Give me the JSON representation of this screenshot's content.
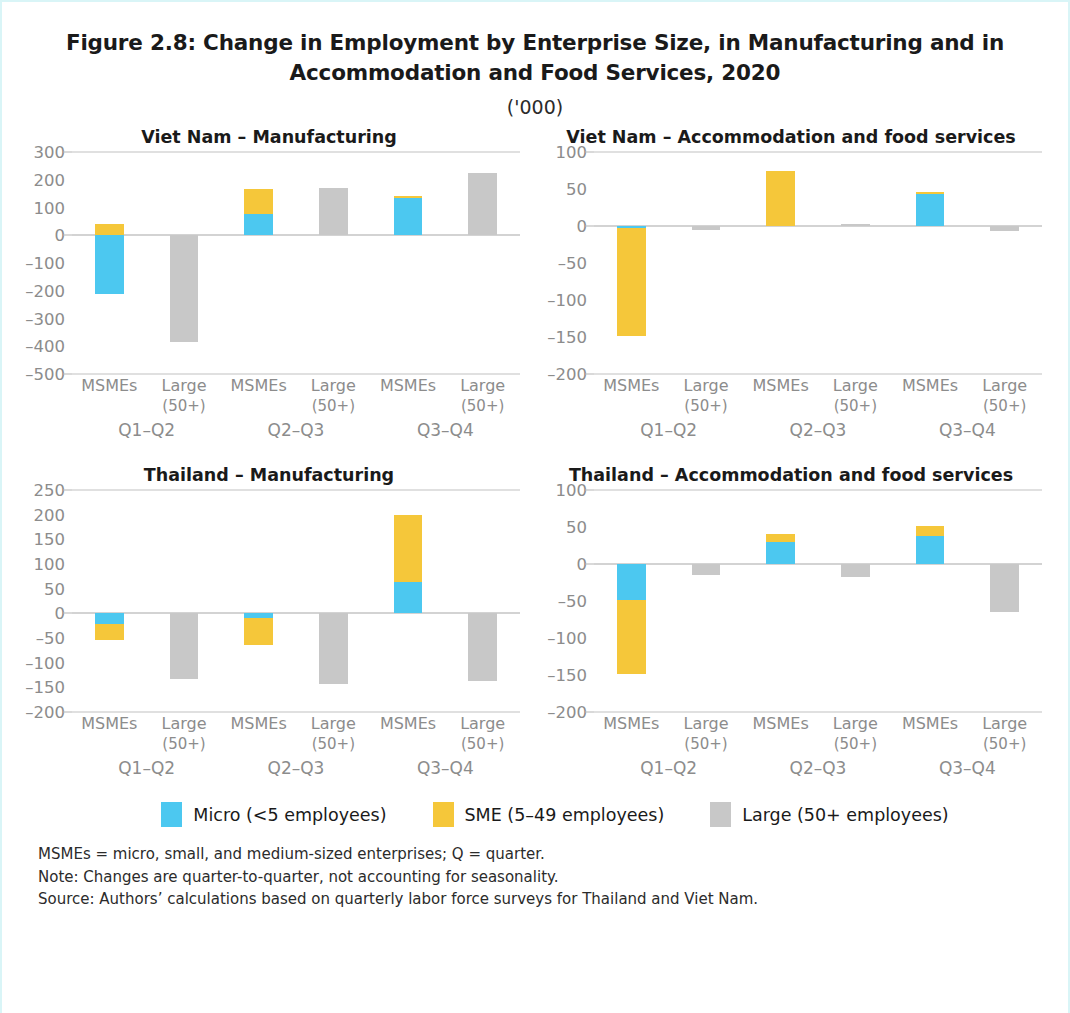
{
  "figure": {
    "title": "Figure 2.8: Change in Employment by Enterprise Size, in Manufacturing and in Accommodation and Food Services, 2020",
    "subtitle": "('000)"
  },
  "legend": {
    "items": [
      {
        "label": "Micro (<5 employees)",
        "color": "#4CC8F0",
        "key": "micro"
      },
      {
        "label": "SME (5–49 employees)",
        "color": "#F5C73A",
        "key": "sme"
      },
      {
        "label": "Large (50+ employees)",
        "color": "#C8C8C8",
        "key": "large"
      }
    ]
  },
  "notes": [
    "MSMEs = micro, small, and medium-sized enterprises; Q = quarter.",
    "Note: Changes are quarter-to-quarter, not accounting for seasonality.",
    "Source: Authors’ calculations based on quarterly labor force surveys for Thailand and Viet Nam."
  ],
  "x_labels": {
    "msmes": "MSMEs",
    "large_main": "Large",
    "large_sub": "(50+)",
    "groups": [
      "Q1–Q2",
      "Q2–Q3",
      "Q3–Q4"
    ]
  },
  "chart_data": [
    {
      "id": "vn-manufacturing",
      "type": "bar",
      "title": "Viet Nam – Manufacturing",
      "xlabel": "",
      "ylabel": "",
      "ylim": [
        -500,
        300
      ],
      "yticks": [
        300,
        200,
        100,
        0,
        -100,
        -200,
        -300,
        -400,
        -500
      ],
      "ytick_labels": [
        "300",
        "200",
        "100",
        "0",
        "–100",
        "–200",
        "–300",
        "–400",
        "–500"
      ],
      "gridlines": [
        300,
        0,
        -500
      ],
      "grid": false,
      "legend_position": "bottom",
      "categories": [
        "Q1–Q2",
        "Q2–Q3",
        "Q3–Q4"
      ],
      "bars": [
        {
          "group": "Q1–Q2",
          "cat": "MSMEs",
          "micro": -210,
          "sme": 40
        },
        {
          "group": "Q1–Q2",
          "cat": "Large (50+)",
          "large": -385
        },
        {
          "group": "Q2–Q3",
          "cat": "MSMEs",
          "micro": 75,
          "sme": 90
        },
        {
          "group": "Q2–Q3",
          "cat": "Large (50+)",
          "large": 170
        },
        {
          "group": "Q3–Q4",
          "cat": "MSMEs",
          "micro": 135,
          "sme": 8
        },
        {
          "group": "Q3–Q4",
          "cat": "Large (50+)",
          "large": 225
        }
      ]
    },
    {
      "id": "vn-accommodation",
      "type": "bar",
      "title": "Viet Nam – Accommodation and food services",
      "xlabel": "",
      "ylabel": "",
      "ylim": [
        -200,
        100
      ],
      "yticks": [
        100,
        50,
        0,
        -50,
        -100,
        -150,
        -200
      ],
      "ytick_labels": [
        "100",
        "50",
        "0",
        "–50",
        "–100",
        "–150",
        "–200"
      ],
      "gridlines": [
        100,
        0,
        -200
      ],
      "grid": false,
      "legend_position": "bottom",
      "categories": [
        "Q1–Q2",
        "Q2–Q3",
        "Q3–Q4"
      ],
      "bars": [
        {
          "group": "Q1–Q2",
          "cat": "MSMEs",
          "micro": -3,
          "sme": -145
        },
        {
          "group": "Q1–Q2",
          "cat": "Large (50+)",
          "large": -5
        },
        {
          "group": "Q2–Q3",
          "cat": "MSMEs",
          "micro": 0,
          "sme": 75
        },
        {
          "group": "Q2–Q3",
          "cat": "Large (50+)",
          "large": 3
        },
        {
          "group": "Q3–Q4",
          "cat": "MSMEs",
          "micro": 43,
          "sme": 3
        },
        {
          "group": "Q3–Q4",
          "cat": "Large (50+)",
          "large": -7
        }
      ]
    },
    {
      "id": "th-manufacturing",
      "type": "bar",
      "title": "Thailand – Manufacturing",
      "xlabel": "",
      "ylabel": "",
      "ylim": [
        -200,
        250
      ],
      "yticks": [
        250,
        200,
        150,
        100,
        50,
        0,
        -50,
        -100,
        -150,
        -200
      ],
      "ytick_labels": [
        "250",
        "200",
        "150",
        "100",
        "50",
        "0",
        "–50",
        "–100",
        "–150",
        "–200"
      ],
      "gridlines": [
        250,
        0,
        -200
      ],
      "grid": false,
      "legend_position": "bottom",
      "categories": [
        "Q1–Q2",
        "Q2–Q3",
        "Q3–Q4"
      ],
      "bars": [
        {
          "group": "Q1–Q2",
          "cat": "MSMEs",
          "micro": -22,
          "sme": -33
        },
        {
          "group": "Q1–Q2",
          "cat": "Large (50+)",
          "large": -133
        },
        {
          "group": "Q2–Q3",
          "cat": "MSMEs",
          "micro": -10,
          "sme": -55
        },
        {
          "group": "Q2–Q3",
          "cat": "Large (50+)",
          "large": -143
        },
        {
          "group": "Q3–Q4",
          "cat": "MSMEs",
          "micro": 63,
          "sme": 137
        },
        {
          "group": "Q3–Q4",
          "cat": "Large (50+)",
          "large": -138
        }
      ]
    },
    {
      "id": "th-accommodation",
      "type": "bar",
      "title": "Thailand – Accommodation and food services",
      "xlabel": "",
      "ylabel": "",
      "ylim": [
        -200,
        100
      ],
      "yticks": [
        100,
        50,
        0,
        -50,
        -100,
        -150,
        -200
      ],
      "ytick_labels": [
        "100",
        "50",
        "0",
        "–50",
        "–100",
        "–150",
        "–200"
      ],
      "gridlines": [
        100,
        0,
        -200
      ],
      "grid": false,
      "legend_position": "bottom",
      "categories": [
        "Q1–Q2",
        "Q2–Q3",
        "Q3–Q4"
      ],
      "bars": [
        {
          "group": "Q1–Q2",
          "cat": "MSMEs",
          "micro": -48,
          "sme": -100
        },
        {
          "group": "Q1–Q2",
          "cat": "Large (50+)",
          "large": -15
        },
        {
          "group": "Q2–Q3",
          "cat": "MSMEs",
          "micro": 30,
          "sme": 10
        },
        {
          "group": "Q2–Q3",
          "cat": "Large (50+)",
          "large": -18
        },
        {
          "group": "Q3–Q4",
          "cat": "MSMEs",
          "micro": 38,
          "sme": 13
        },
        {
          "group": "Q3–Q4",
          "cat": "Large (50+)",
          "large": -65
        }
      ]
    }
  ]
}
